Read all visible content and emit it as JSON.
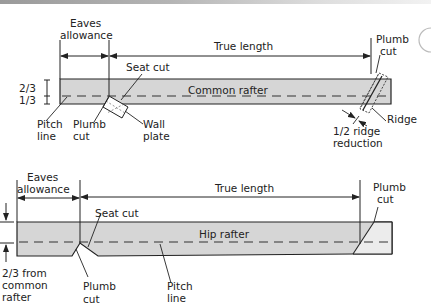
{
  "colors": {
    "rafter_fill": "#d6d6d6",
    "line": "#222222",
    "background": "#ffffff"
  },
  "common_rafter": {
    "label": "Common rafter",
    "eaves_label_1": "Eaves",
    "eaves_label_2": "allowance",
    "true_length": "True length",
    "plumb_cut_top_1": "Plumb",
    "plumb_cut_top_2": "cut",
    "seat_cut": "Seat cut",
    "ratio_top": "2/3",
    "ratio_bottom": "1/3",
    "pitch_line_1": "Pitch",
    "pitch_line_2": "line",
    "plumb_cut_1": "Plumb",
    "plumb_cut_2": "cut",
    "wall_plate_1": "Wall",
    "wall_plate_2": "plate",
    "ridge": "Ridge",
    "ridge_reduction_1": "1/2 ridge",
    "ridge_reduction_2": "reduction"
  },
  "hip_rafter": {
    "label": "Hip rafter",
    "eaves_label_1": "Eaves",
    "eaves_label_2": "allowance",
    "true_length": "True length",
    "plumb_cut_top_1": "Plumb",
    "plumb_cut_top_2": "cut",
    "seat_cut": "Seat cut",
    "from_common_1": "2/3 from",
    "from_common_2": "common",
    "from_common_3": "rafter",
    "plumb_cut_1": "Plumb",
    "plumb_cut_2": "cut",
    "pitch_line_1": "Pitch",
    "pitch_line_2": "line"
  }
}
